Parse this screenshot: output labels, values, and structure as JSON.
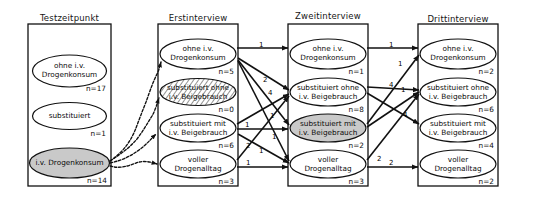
{
  "diagram": {
    "title_row": [
      "Testzeitpunkt",
      "Erstinterview",
      "Zweitinterview",
      "Drittinterview"
    ],
    "n_prefix": "n=",
    "columns": [
      {
        "id": "testzeitpunkt",
        "title": "Testzeitpunkt",
        "nodes": [
          {
            "id": "t-ohne",
            "line1": "ohne i.v.",
            "line2": "Drogenkonsum",
            "n": "n=17",
            "fill": "white"
          },
          {
            "id": "t-subst",
            "line1": "substituiert",
            "line2": "",
            "n": "n=1",
            "fill": "white"
          },
          {
            "id": "t-iv",
            "line1": "i.v. Drogenkonsum",
            "line2": "",
            "n": "n=14",
            "fill": "grey"
          }
        ]
      },
      {
        "id": "erstinterview",
        "title": "Erstinterview",
        "nodes": [
          {
            "id": "e-ohne",
            "line1": "ohne  i.v.",
            "line2": "Drogenkonsum",
            "n": "n=5",
            "fill": "white"
          },
          {
            "id": "e-so",
            "line1": "substituiert ohne",
            "line2": "i.v. Beigebrauch",
            "n": "n=0",
            "fill": "hatched"
          },
          {
            "id": "e-sm",
            "line1": "substituiert mit",
            "line2": "i.v. Beigebrauch",
            "n": "n=6",
            "fill": "white"
          },
          {
            "id": "e-voll",
            "line1": "voller",
            "line2": "Drogenalltag",
            "n": "n=3",
            "fill": "white"
          }
        ]
      },
      {
        "id": "zweitinterview",
        "title": "Zweitinterview",
        "nodes": [
          {
            "id": "z-ohne",
            "line1": "ohne  i.v.",
            "line2": "Drogenkonsum",
            "n": "n=1",
            "fill": "white"
          },
          {
            "id": "z-so",
            "line1": "substituiert ohne",
            "line2": "i.v. Beigebrauch",
            "n": "n=8",
            "fill": "white"
          },
          {
            "id": "z-sm",
            "line1": "substituiert mit",
            "line2": "i.v. Beigebrauch",
            "n": "n=2",
            "fill": "grey"
          },
          {
            "id": "z-voll",
            "line1": "voller",
            "line2": "Drogenalltag",
            "n": "n=3",
            "fill": "white"
          }
        ]
      },
      {
        "id": "drittinterview",
        "title": "Drittinterview",
        "nodes": [
          {
            "id": "d-ohne",
            "line1": "ohne  i.v.",
            "line2": "Drogenkonsum",
            "n": "n=2",
            "fill": "white"
          },
          {
            "id": "d-so",
            "line1": "substituiert ohne",
            "line2": "i.v. Beigebrauch",
            "n": "n=6",
            "fill": "white"
          },
          {
            "id": "d-sm",
            "line1": "substituiert mit",
            "line2": "i.v. Beigebrauch",
            "n": "n=4",
            "fill": "white"
          },
          {
            "id": "d-voll",
            "line1": "voller",
            "line2": "Drogenalltag",
            "n": "n=2",
            "fill": "white"
          }
        ]
      }
    ],
    "flows_1_2": [
      {
        "from": "t-iv",
        "to": "e-ohne",
        "label": "",
        "style": "squiggle"
      },
      {
        "from": "t-iv",
        "to": "e-so",
        "label": "",
        "style": "squiggle"
      },
      {
        "from": "t-iv",
        "to": "e-sm",
        "label": "",
        "style": "squiggle"
      },
      {
        "from": "t-iv",
        "to": "e-voll",
        "label": "",
        "style": "squiggle"
      }
    ],
    "flows_2_3": [
      {
        "from": "e-ohne",
        "to": "z-ohne",
        "label": "1"
      },
      {
        "from": "e-ohne",
        "to": "z-so",
        "label": "2"
      },
      {
        "from": "e-ohne",
        "to": "z-sm",
        "label": "1"
      },
      {
        "from": "e-ohne",
        "to": "z-voll",
        "label": "1"
      },
      {
        "from": "e-sm",
        "to": "z-so",
        "label": "4"
      },
      {
        "from": "e-sm",
        "to": "z-sm",
        "label": "1"
      },
      {
        "from": "e-sm",
        "to": "z-voll",
        "label": "1"
      },
      {
        "from": "e-voll",
        "to": "z-so",
        "label": "2"
      },
      {
        "from": "e-voll",
        "to": "z-voll",
        "label": "1"
      }
    ],
    "flows_3_4": [
      {
        "from": "z-ohne",
        "to": "d-ohne",
        "label": "1"
      },
      {
        "from": "z-so",
        "to": "d-so",
        "label": "4"
      },
      {
        "from": "z-so",
        "to": "d-sm",
        "label": "4"
      },
      {
        "from": "z-sm",
        "to": "d-ohne",
        "label": "1"
      },
      {
        "from": "z-sm",
        "to": "d-so",
        "label": "1"
      },
      {
        "from": "z-voll",
        "to": "d-so",
        "label": "2"
      },
      {
        "from": "z-voll",
        "to": "d-voll",
        "label": "2"
      }
    ],
    "colors": {
      "stroke": "#111111",
      "node_fill": "#ffffff",
      "highlight_fill": "#c9c9c9",
      "background": "#ffffff"
    }
  }
}
